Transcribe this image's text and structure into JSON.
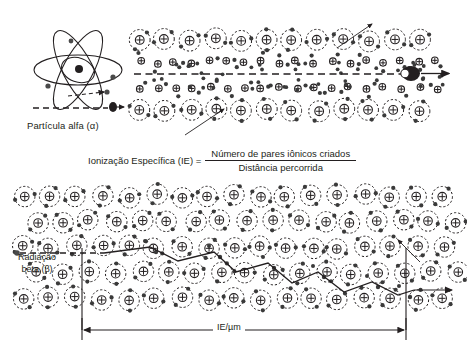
{
  "figure": {
    "background": "#ffffff",
    "ink": "#231f20"
  },
  "alpha_panel": {
    "caption": "Partícula alfa (α)",
    "atom_label": "nucleus",
    "track_style": "dashed",
    "particle_name": "alpha-particle"
  },
  "formula": {
    "lhs": "Ionização Específica (IE) =",
    "numerator": "Número de pares iônicos criados",
    "denominator": "Distância percorrida"
  },
  "beta_panel": {
    "caption_line1": "Radiação",
    "caption_line2": "beta (β)",
    "measure_label": "IE/µm",
    "track_style": "zigzag"
  },
  "icons": {
    "nucleus": "plus-circle-icon",
    "electron": "electron-dot-icon",
    "shell": "dashed-shell-icon",
    "arrow": "arrow-icon"
  },
  "chart_data": {
    "type": "diagram",
    "panels": [
      {
        "name": "alpha",
        "particle": "Partícula alfa (α)",
        "track": "straight",
        "ionization_density": "high",
        "atom_rows": 4,
        "ionized_rows": 2
      },
      {
        "name": "beta",
        "particle": "Radiação beta (β)",
        "track": "zigzag",
        "ionization_density": "low",
        "measure": "IE/µm"
      }
    ]
  }
}
